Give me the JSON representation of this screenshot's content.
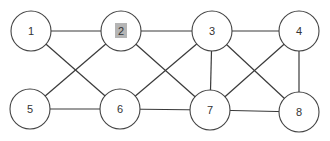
{
  "diagram": {
    "type": "undirected-graph",
    "highlight_color": "#b5b5b5",
    "stroke_color": "#3a3a3a",
    "node_radius": 20,
    "nodes": [
      {
        "id": "1",
        "label": "1",
        "x": 31,
        "y": 31,
        "highlighted": false
      },
      {
        "id": "2",
        "label": "2",
        "x": 121,
        "y": 31,
        "highlighted": true
      },
      {
        "id": "3",
        "label": "3",
        "x": 212,
        "y": 31,
        "highlighted": false
      },
      {
        "id": "4",
        "label": "4",
        "x": 299,
        "y": 31,
        "highlighted": false
      },
      {
        "id": "5",
        "label": "5",
        "x": 30,
        "y": 109,
        "highlighted": false
      },
      {
        "id": "6",
        "label": "6",
        "x": 120,
        "y": 109,
        "highlighted": false
      },
      {
        "id": "7",
        "label": "7",
        "x": 210,
        "y": 110,
        "highlighted": false
      },
      {
        "id": "8",
        "label": "8",
        "x": 299,
        "y": 112,
        "highlighted": false
      }
    ],
    "edges": [
      [
        "1",
        "2"
      ],
      [
        "1",
        "6"
      ],
      [
        "2",
        "3"
      ],
      [
        "2",
        "5"
      ],
      [
        "2",
        "7"
      ],
      [
        "5",
        "6"
      ],
      [
        "6",
        "3"
      ],
      [
        "6",
        "7"
      ],
      [
        "3",
        "4"
      ],
      [
        "3",
        "7"
      ],
      [
        "3",
        "8"
      ],
      [
        "4",
        "7"
      ],
      [
        "4",
        "8"
      ],
      [
        "7",
        "8"
      ]
    ]
  }
}
